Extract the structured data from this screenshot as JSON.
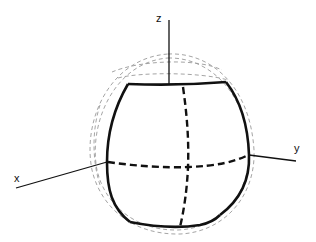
{
  "diagram": {
    "type": "3d-deformed-sphere",
    "axes": {
      "x": {
        "label": "x"
      },
      "y": {
        "label": "y"
      },
      "z": {
        "label": "z"
      }
    },
    "colors": {
      "solid_outline": "#111111",
      "reference_sphere": "#9a9a9a",
      "background": "#ffffff"
    },
    "elements": [
      "deformed-body-outline (solid)",
      "equator-line (dashed)",
      "meridian-line (dashed)",
      "reference-sphere-outlines (light dashed)"
    ]
  }
}
